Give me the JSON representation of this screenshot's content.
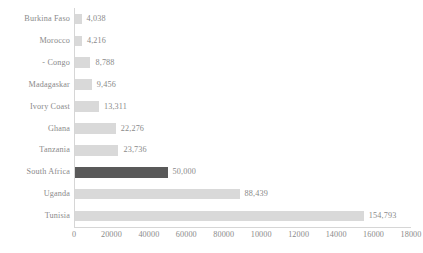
{
  "chart_data": {
    "type": "bar",
    "orientation": "horizontal",
    "title": "",
    "subtitle": "",
    "xlabel": "",
    "ylabel": "",
    "xlim": [
      0,
      180000
    ],
    "xticks": [
      0,
      20000,
      40000,
      60000,
      80000,
      100000,
      120000,
      140000,
      160000,
      180000
    ],
    "xtick_labels": [
      "0",
      "20000",
      "40000",
      "60000",
      "80000",
      "10000",
      "12000",
      "14000",
      "16000",
      "18000"
    ],
    "grid": false,
    "legend": false,
    "categories": [
      "Burkina Faso",
      "Morocco",
      "- Congo",
      "Madagaskar",
      "Ivory Coast",
      "Ghana",
      "Tanzania",
      "South Africa",
      "Uganda",
      "Tunisia"
    ],
    "values": [
      4038,
      4216,
      8788,
      9456,
      13311,
      22276,
      23736,
      50000,
      88439,
      154793
    ],
    "value_labels": [
      "4,038",
      "4,216",
      "8,788",
      "9,456",
      "13,311",
      "22,276",
      "23,736",
      "50,000",
      "88,439",
      "154,793"
    ],
    "highlight_index": 7,
    "colors": {
      "bar": "#d9d9d9",
      "bar_highlight": "#595959",
      "text": "#8a8a8a",
      "axis": "#d6d6d6",
      "background": "#ffffff"
    }
  }
}
